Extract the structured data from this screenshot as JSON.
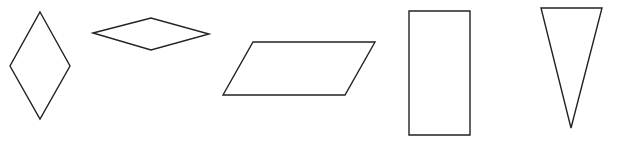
{
  "canvas": {
    "width": 625,
    "height": 146,
    "background": "#ffffff",
    "stroke_color": "#222222"
  },
  "shapes": [
    {
      "type": "rhombus-vertical",
      "points": "40,12 70,66 40,119 10,66"
    },
    {
      "type": "rhombus-horizontal",
      "points": "93,33 151,18 209,34 151,50"
    },
    {
      "type": "parallelogram",
      "points": "253,42 375,42 345,95 223,95"
    },
    {
      "type": "rectangle",
      "points": "409,11 470,11 470,135 409,135"
    },
    {
      "type": "triangle-inverted",
      "points": "541,8 602,8 571,128"
    }
  ]
}
